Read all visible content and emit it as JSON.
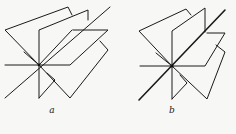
{
  "figures": [
    {
      "id": "a",
      "label": "a",
      "description": "Pencil of half-planes meeting along a common line (open fan)"
    },
    {
      "id": "b",
      "label": "b",
      "description": "Pencil of half-planes meeting along a common line (with doubled diagonal edge)"
    }
  ],
  "colors": {
    "stroke": "#1a1a1a",
    "background": "#f7f7f5"
  }
}
